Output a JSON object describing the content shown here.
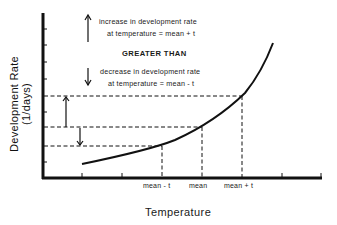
{
  "diagram": {
    "y_axis_label": "Development Rate (1/days)",
    "x_axis_label": "Temperature",
    "annotations": {
      "increase_line1": "increase in development rate",
      "increase_line2": "at temperature = mean + t",
      "comparison": "GREATER THAN",
      "decrease_line1": "decrease in development rate",
      "decrease_line2": "at temperature = mean - t"
    },
    "x_ticks": {
      "mean_minus_t": "mean - t",
      "mean": "mean",
      "mean_plus_t": "mean + t"
    },
    "icons": {
      "up_arrow": "arrow-up-icon",
      "down_arrow": "arrow-down-icon"
    },
    "colors": {
      "line": "#111111",
      "background": "#ffffff"
    }
  }
}
